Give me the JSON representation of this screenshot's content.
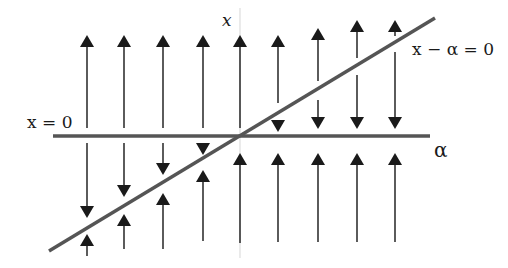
{
  "diagram": {
    "type": "bifurcation-phase-portrait",
    "labels": {
      "vertical_axis": "x",
      "horizontal_axis": "α",
      "branch_zero": "x = 0",
      "branch_diagonal": "x − α = 0"
    },
    "colors": {
      "branch_line": "#555555",
      "axis_line": "#dddddd",
      "arrow": "#1a1a1a",
      "background": "#ffffff"
    },
    "branches": [
      {
        "name": "x = 0",
        "from": [
          53,
          136
        ],
        "to": [
          430,
          136
        ]
      },
      {
        "name": "x − α = 0",
        "from": [
          49,
          251
        ],
        "to": [
          435,
          18
        ]
      }
    ],
    "vertical_axis": {
      "x": 240,
      "y1": 8,
      "y2": 258
    },
    "arrows": [
      {
        "x": 87,
        "dir": "up",
        "y1": 128,
        "y2": 35
      },
      {
        "x": 124,
        "dir": "up",
        "y1": 128,
        "y2": 35
      },
      {
        "x": 163,
        "dir": "up",
        "y1": 128,
        "y2": 35
      },
      {
        "x": 203,
        "dir": "up",
        "y1": 128,
        "y2": 35
      },
      {
        "x": 240,
        "dir": "up",
        "y1": 128,
        "y2": 35
      },
      {
        "x": 278,
        "dir": "up",
        "y1": 103,
        "y2": 35
      },
      {
        "x": 318,
        "dir": "up",
        "y1": 81,
        "y2": 28
      },
      {
        "x": 357,
        "dir": "up",
        "y1": 58,
        "y2": 20
      },
      {
        "x": 395,
        "dir": "up",
        "y1": 36,
        "y2": 20
      },
      {
        "x": 278,
        "dir": "down",
        "y1": 120,
        "y2": 132
      },
      {
        "x": 318,
        "dir": "down",
        "y1": 100,
        "y2": 129
      },
      {
        "x": 357,
        "dir": "down",
        "y1": 75,
        "y2": 129
      },
      {
        "x": 395,
        "dir": "down",
        "y1": 52,
        "y2": 129
      },
      {
        "x": 87,
        "dir": "down",
        "y1": 143,
        "y2": 218
      },
      {
        "x": 124,
        "dir": "down",
        "y1": 143,
        "y2": 197
      },
      {
        "x": 163,
        "dir": "down",
        "y1": 143,
        "y2": 175
      },
      {
        "x": 203,
        "dir": "down",
        "y1": 145,
        "y2": 155
      },
      {
        "x": 87,
        "dir": "up",
        "y1": 256,
        "y2": 234
      },
      {
        "x": 124,
        "dir": "up",
        "y1": 249,
        "y2": 214
      },
      {
        "x": 163,
        "dir": "up",
        "y1": 249,
        "y2": 193
      },
      {
        "x": 203,
        "dir": "up",
        "y1": 241,
        "y2": 170
      },
      {
        "x": 240,
        "dir": "up",
        "y1": 243,
        "y2": 153
      },
      {
        "x": 278,
        "dir": "up",
        "y1": 242,
        "y2": 153
      },
      {
        "x": 318,
        "dir": "up",
        "y1": 242,
        "y2": 153
      },
      {
        "x": 357,
        "dir": "up",
        "y1": 242,
        "y2": 153
      },
      {
        "x": 395,
        "dir": "up",
        "y1": 242,
        "y2": 153
      }
    ]
  }
}
